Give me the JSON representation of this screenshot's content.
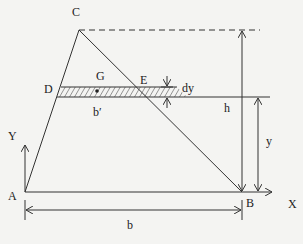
{
  "diagram": {
    "type": "geometry",
    "points": {
      "A": {
        "label": "A",
        "x": 25,
        "y": 192
      },
      "B": {
        "label": "B",
        "x": 242,
        "y": 192
      },
      "C": {
        "label": "C",
        "x": 79,
        "y": 30
      },
      "D": {
        "label": "D",
        "x": 57,
        "y": 97
      },
      "E": {
        "label": "E",
        "x": 177,
        "y": 87
      },
      "G": {
        "label": "G"
      }
    },
    "labels": {
      "A": "A",
      "B": "B",
      "C": "C",
      "D": "D",
      "E": "E",
      "G": "G",
      "b_prime": "b′",
      "dy": "dy",
      "h": "h",
      "y": "y",
      "b": "b",
      "X": "X",
      "Y": "Y"
    },
    "colors": {
      "stroke": "#333333",
      "background": "#f4f4f2"
    }
  }
}
